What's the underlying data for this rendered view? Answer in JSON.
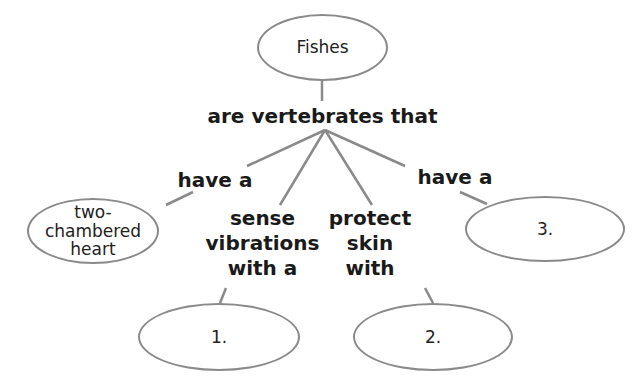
{
  "diagram": {
    "type": "concept_map",
    "root": {
      "label": "Fishes"
    },
    "root_link": {
      "label": "are vertebrates that"
    },
    "branches": [
      {
        "link_label": "have a",
        "node_label": "two-chambered heart"
      },
      {
        "link_label": "sense vibrations with a",
        "node_label": "1."
      },
      {
        "link_label": "protect skin with",
        "node_label": "2."
      },
      {
        "link_label": "have a",
        "node_label": "3."
      }
    ],
    "colors": {
      "line": "#8a8a8a",
      "text": "#1a1a1a",
      "background": "#ffffff"
    }
  },
  "nodes": {
    "fishes": "Fishes",
    "heart_line1": "two-chambered",
    "heart_line2": "heart",
    "blank1": "1.",
    "blank2": "2.",
    "blank3": "3."
  },
  "links": {
    "main": "are vertebrates that",
    "have_a_left": "have a",
    "sense_line1": "sense",
    "sense_line2": "vibrations",
    "sense_line3": "with a",
    "protect_line1": "protect",
    "protect_line2": "skin",
    "protect_line3": "with",
    "have_a_right": "have a"
  }
}
